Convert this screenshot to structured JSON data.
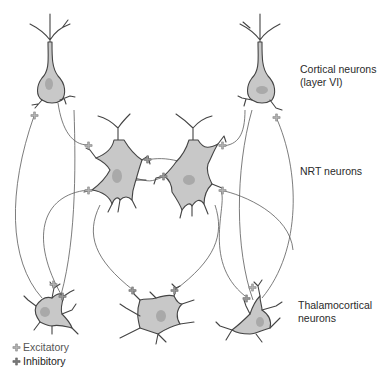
{
  "diagram": {
    "labels": {
      "cortical_line1": "Cortical neurons",
      "cortical_line2": "(layer VI)",
      "nrt": "NRT neurons",
      "thalamocortical_line1": "Thalamocortical",
      "thalamocortical_line2": "neurons"
    },
    "legend": {
      "excitatory": "Excitatory",
      "inhibitory": "Inhibitory"
    },
    "colors": {
      "soma_fill": "#c8c8c8",
      "nucleus_fill": "#a9a9a9",
      "outline": "#444444",
      "connection": "#555555",
      "excitatory_synapse": "#b5b5b5",
      "inhibitory_synapse": "#7a7a7a"
    },
    "neuron_groups": [
      {
        "id": "cortical",
        "count": 2
      },
      {
        "id": "nrt",
        "count": 2
      },
      {
        "id": "thalamocortical",
        "count": 3
      }
    ],
    "connections": [
      {
        "from": "cortical-left",
        "to": "nrt-left",
        "type": "excitatory"
      },
      {
        "from": "cortical-left",
        "to": "thalamocortical-left",
        "type": "excitatory"
      },
      {
        "from": "cortical-right",
        "to": "nrt-right",
        "type": "excitatory"
      },
      {
        "from": "cortical-right",
        "to": "thalamocortical-right",
        "type": "excitatory"
      },
      {
        "from": "nrt-left",
        "to": "nrt-right",
        "type": "inhibitory"
      },
      {
        "from": "nrt-right",
        "to": "nrt-left",
        "type": "inhibitory"
      },
      {
        "from": "nrt-left",
        "to": "thalamocortical-middle",
        "type": "inhibitory"
      },
      {
        "from": "nrt-right",
        "to": "thalamocortical-middle",
        "type": "inhibitory"
      },
      {
        "from": "thalamocortical-left",
        "to": "cortical-left",
        "type": "excitatory"
      },
      {
        "from": "thalamocortical-left",
        "to": "nrt-left",
        "type": "excitatory"
      },
      {
        "from": "thalamocortical-right",
        "to": "cortical-right",
        "type": "excitatory"
      },
      {
        "from": "thalamocortical-right",
        "to": "nrt-right",
        "type": "excitatory"
      },
      {
        "from": "nrt-left",
        "to": "thalamocortical-left",
        "type": "inhibitory"
      },
      {
        "from": "nrt-right",
        "to": "thalamocortical-right",
        "type": "inhibitory"
      }
    ]
  }
}
